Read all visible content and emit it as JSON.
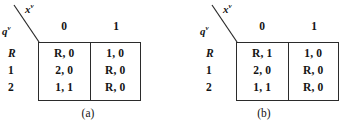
{
  "figure": {
    "panels": [
      {
        "id": "a",
        "caption": "(a)",
        "axis_row_label": "q",
        "axis_row_superscript": "v",
        "axis_col_label": "x",
        "axis_col_superscript": "v",
        "column_headers": [
          "0",
          "1"
        ],
        "row_headers": [
          "R",
          "1",
          "2"
        ],
        "cells": [
          [
            "R, 0",
            "1, 0"
          ],
          [
            "2, 0",
            "R, 0"
          ],
          [
            "1, 1",
            "R, 0"
          ]
        ]
      },
      {
        "id": "b",
        "caption": "(b)",
        "axis_row_label": "q",
        "axis_row_superscript": "v",
        "axis_col_label": "x",
        "axis_col_superscript": "v",
        "column_headers": [
          "0",
          "1"
        ],
        "row_headers": [
          "R",
          "1",
          "2"
        ],
        "cells": [
          [
            "R, 1",
            "1, 0"
          ],
          [
            "2, 0",
            "R, 0"
          ],
          [
            "1, 1",
            "R, 0"
          ]
        ]
      }
    ],
    "colors": {
      "ink": "#141414",
      "rule": "#2b2b2b",
      "background": "#ffffff"
    }
  }
}
